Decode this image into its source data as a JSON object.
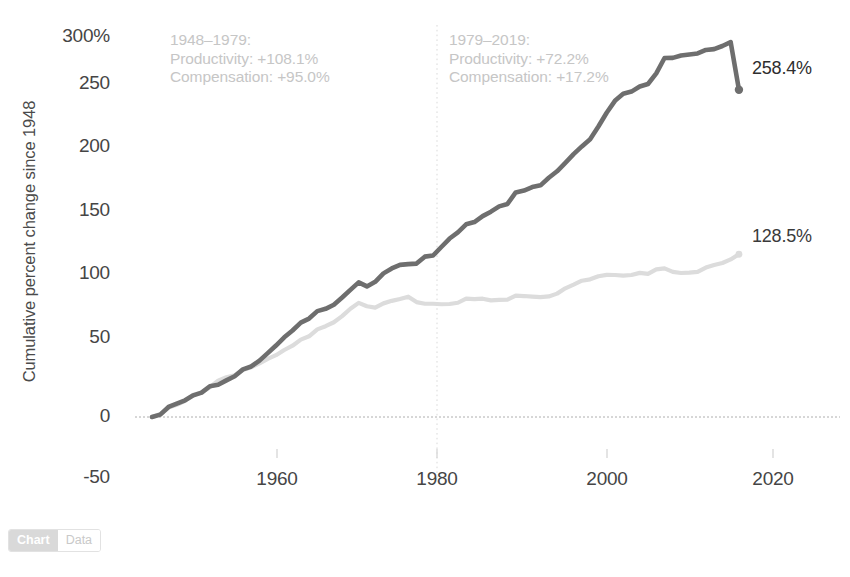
{
  "chart_data": {
    "type": "line",
    "title": "",
    "xlabel": "",
    "ylabel": "Cumulative percent change since 1948",
    "xlim": [
      1948,
      2019
    ],
    "ylim": [
      -50,
      300
    ],
    "grid": false,
    "legend_position": "none",
    "x_ticks": [
      "1960",
      "1980",
      "2000",
      "2020"
    ],
    "x_tick_values": [
      1960,
      1980,
      2000,
      2020
    ],
    "y_ticks": [
      "300%",
      "250",
      "200",
      "150",
      "100",
      "50",
      "0",
      "-50"
    ],
    "y_tick_values": [
      300,
      250,
      200,
      150,
      100,
      50,
      0,
      -50
    ],
    "reference_line_x": 1979,
    "zero_baseline": 0,
    "series": [
      {
        "name": "Productivity",
        "color": "#6e6e6e",
        "end_label": "258.4%",
        "end_value": 258.4,
        "x": [
          1948,
          1949,
          1950,
          1951,
          1952,
          1953,
          1954,
          1955,
          1956,
          1957,
          1958,
          1959,
          1960,
          1961,
          1962,
          1963,
          1964,
          1965,
          1966,
          1967,
          1968,
          1969,
          1970,
          1971,
          1972,
          1973,
          1974,
          1975,
          1976,
          1977,
          1978,
          1979,
          1980,
          1981,
          1982,
          1983,
          1984,
          1985,
          1986,
          1987,
          1988,
          1989,
          1990,
          1991,
          1992,
          1993,
          1994,
          1995,
          1996,
          1997,
          1998,
          1999,
          2000,
          2001,
          2002,
          2003,
          2004,
          2005,
          2006,
          2007,
          2008,
          2009,
          2010,
          2011,
          2012,
          2013,
          2014,
          2015,
          2016,
          2017,
          2018,
          2019
        ],
        "values": [
          0,
          1.9,
          7.9,
          10.6,
          13.2,
          17.1,
          19.2,
          24.3,
          25.4,
          28.9,
          32.2,
          37.6,
          39.9,
          44.5,
          50.4,
          56.4,
          62.9,
          68.3,
          74.5,
          77.7,
          83.6,
          85.4,
          88.6,
          94.3,
          100.4,
          106.3,
          103.1,
          106.7,
          113.4,
          117.3,
          120.1,
          120.7,
          121.1,
          126.6,
          127.5,
          134.2,
          140.9,
          145.8,
          152.1,
          153.9,
          158.6,
          162.1,
          166.3,
          168.2,
          177.3,
          178.8,
          181.5,
          182.9,
          188.9,
          194.0,
          200.6,
          207.5,
          213.6,
          219.2,
          229.3,
          240.2,
          249.6,
          255.2,
          256.9,
          260.9,
          262.9,
          271.3,
          283.4,
          283.5,
          285.4,
          286.2,
          287.0,
          289.8,
          290.4,
          292.9,
          296.0,
          258.4
        ]
      },
      {
        "name": "Compensation",
        "color": "#dcdcdc",
        "end_label": "128.5%",
        "end_value": 128.5,
        "x": [
          1948,
          1949,
          1950,
          1951,
          1952,
          1953,
          1954,
          1955,
          1956,
          1957,
          1958,
          1959,
          1960,
          1961,
          1962,
          1963,
          1964,
          1965,
          1966,
          1967,
          1968,
          1969,
          1970,
          1971,
          1972,
          1973,
          1974,
          1975,
          1976,
          1977,
          1978,
          1979,
          1980,
          1981,
          1982,
          1983,
          1984,
          1985,
          1986,
          1987,
          1988,
          1989,
          1990,
          1991,
          1992,
          1993,
          1994,
          1995,
          1996,
          1997,
          1998,
          1999,
          2000,
          2001,
          2002,
          2003,
          2004,
          2005,
          2006,
          2007,
          2008,
          2009,
          2010,
          2011,
          2012,
          2013,
          2014,
          2015,
          2016,
          2017,
          2018,
          2019
        ],
        "values": [
          0,
          2.3,
          7.4,
          9.6,
          12.8,
          17.5,
          19.4,
          23.6,
          28.7,
          31.4,
          32.9,
          37.1,
          39.3,
          42.3,
          45.9,
          48.8,
          52.9,
          56.3,
          61.1,
          63.7,
          69.2,
          71.7,
          74.8,
          79.6,
          85.5,
          90.1,
          87.4,
          86.3,
          89.7,
          91.7,
          93.1,
          95.0,
          90.7,
          89.4,
          89.4,
          89.0,
          89.2,
          90.2,
          93.5,
          93.1,
          93.4,
          92.1,
          92.5,
          92.7,
          95.8,
          95.5,
          95.0,
          94.6,
          95.2,
          97.4,
          101.6,
          104.5,
          107.6,
          108.7,
          111.1,
          112.2,
          112.1,
          111.6,
          112.1,
          113.8,
          113.0,
          116.5,
          117.3,
          114.6,
          113.7,
          114.0,
          114.6,
          118.0,
          120.0,
          121.6,
          124.4,
          128.5
        ]
      }
    ],
    "annotations": [
      {
        "id": "period-1",
        "lines": [
          "1948–1979:",
          "Productivity: +108.1%",
          "Compensation: +95.0%"
        ],
        "period": "1948–1979",
        "productivity_change": "+108.1%",
        "compensation_change": "+95.0%"
      },
      {
        "id": "period-2",
        "lines": [
          "1979–2019:",
          "Productivity: +72.2%",
          "Compensation: +17.2%"
        ],
        "period": "1979–2019",
        "productivity_change": "+72.2%",
        "compensation_change": "+17.2%"
      }
    ]
  },
  "toggle": {
    "chart_label": "Chart",
    "data_label": "Data",
    "active": "Chart"
  },
  "colors": {
    "productivity_line": "#6e6e6e",
    "compensation_line": "#dcdcdc",
    "annotation_text": "#c6c6c6",
    "axis_text": "#454545",
    "reference_line": "#d6d6d6",
    "baseline": "#a8a8a8"
  }
}
